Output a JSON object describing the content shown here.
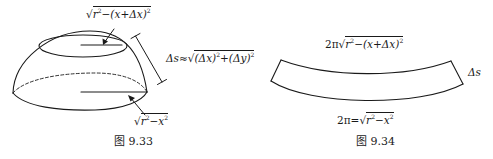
{
  "figures": [
    {
      "id": "fig-9-33",
      "caption": "图 9.33",
      "labels": {
        "top_radius": "√r²−(x+Δx)²",
        "top_radius_rad": "r",
        "top_radius_tail": "−(x+Δx)",
        "arc_length_prefix": "Δs≈",
        "arc_length_radicand": "(Δx)²+(Δy)²",
        "bottom_radius_rad": "r",
        "bottom_radius_tail": "−x"
      }
    },
    {
      "id": "fig-9-34",
      "caption": "图 9.34",
      "labels": {
        "top_circumference_prefix": "2π",
        "top_circumference_rad": "r",
        "top_circumference_tail": "−(x+Δx)",
        "width_label": "Δs",
        "bottom_circumference_prefix": "2π=",
        "bottom_circumference_rad": "r",
        "bottom_circumference_tail": "−x"
      }
    }
  ],
  "colors": {
    "stroke": "#1a1a1a",
    "background": "#ffffff"
  }
}
